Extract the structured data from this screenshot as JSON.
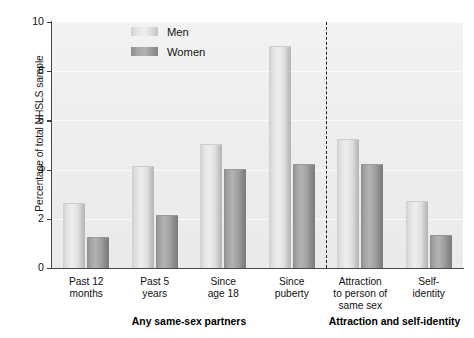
{
  "chart_data": {
    "type": "bar",
    "title": "",
    "xlabel": "",
    "ylabel": "Percentage of total NHSLS sample",
    "ylim": [
      0,
      10
    ],
    "ytick_labels": [
      "0",
      "2",
      "4",
      "6",
      "8",
      "10"
    ],
    "ytick_values": [
      0,
      2,
      4,
      6,
      8,
      10
    ],
    "grid": true,
    "legend_position": "top-center",
    "categories": [
      "Past 12 months",
      "Past 5 years",
      "Since age 18",
      "Since puberty",
      "Attraction to person of same sex",
      "Self-identity"
    ],
    "category_lines": [
      [
        "Past 12",
        "months"
      ],
      [
        "Past 5",
        "years"
      ],
      [
        "Since",
        "age 18"
      ],
      [
        "Since",
        "puberty"
      ],
      [
        "Attraction",
        "to person of",
        "same sex"
      ],
      [
        "Self-",
        "identity"
      ]
    ],
    "series": [
      {
        "name": "Men",
        "color": "#e2e2e2",
        "values": [
          2.6,
          4.1,
          5.0,
          9.0,
          5.2,
          2.7
        ]
      },
      {
        "name": "Women",
        "color": "#9a9a9a",
        "values": [
          1.2,
          2.1,
          4.0,
          4.2,
          4.2,
          1.3
        ]
      }
    ],
    "group_labels": [
      {
        "text": "Any same-sex partners",
        "spans": [
          0,
          1,
          2,
          3
        ]
      },
      {
        "text": "Attraction and self-identity",
        "spans": [
          4,
          5
        ]
      }
    ],
    "divider": {
      "style": "dashed",
      "after_category_index": 3
    }
  }
}
